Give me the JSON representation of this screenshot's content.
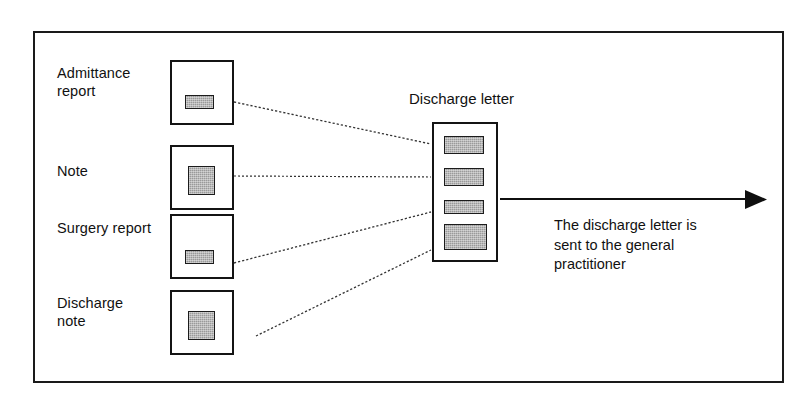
{
  "figure": {
    "frame_color": "#1a1a1a",
    "background": "#ffffff",
    "block_fill": "#9a9a9a"
  },
  "documents": [
    {
      "label": "Admittance\nreport",
      "name": "admittance-report"
    },
    {
      "label": "Note",
      "name": "note"
    },
    {
      "label": "Surgery report",
      "name": "surgery-report"
    },
    {
      "label": "Discharge\nnote",
      "name": "discharge-note"
    }
  ],
  "discharge_letter": {
    "title": "Discharge letter",
    "segment_count": 4
  },
  "caption": {
    "text": "The discharge letter is\nsent to the general\npractitioner"
  }
}
